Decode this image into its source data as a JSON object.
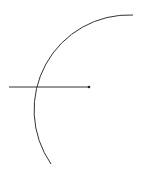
{
  "diagram": {
    "background": "#ffffff",
    "stroke_color": "#333333",
    "arc": {
      "center": [
        130,
        108
      ],
      "radius": 95,
      "start": [
        133,
        15
      ],
      "end": [
        51,
        164
      ]
    },
    "ray": {
      "start": [
        9,
        87
      ],
      "end": [
        89,
        87
      ],
      "end_dot_radius": 1.3
    }
  }
}
